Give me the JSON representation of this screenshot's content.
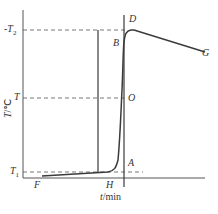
{
  "diagram": {
    "type": "temperature-time curve",
    "axes": {
      "x_label_var": "t",
      "x_label_unit": "/min",
      "y_label_var": "T",
      "y_label_unit": "/℃"
    },
    "levels": {
      "T2_label": "T",
      "T2_sub": "2",
      "T2_prefix": "-",
      "T_label": "T",
      "T1_label": "T",
      "T1_sub": "1"
    },
    "points": {
      "D": "D",
      "B": "B",
      "O": "O",
      "A": "A",
      "H": "H",
      "F": "F",
      "G": "G"
    },
    "colors": {
      "line": "#3a3a3a",
      "dash": "#555555",
      "text": "#333333"
    }
  }
}
